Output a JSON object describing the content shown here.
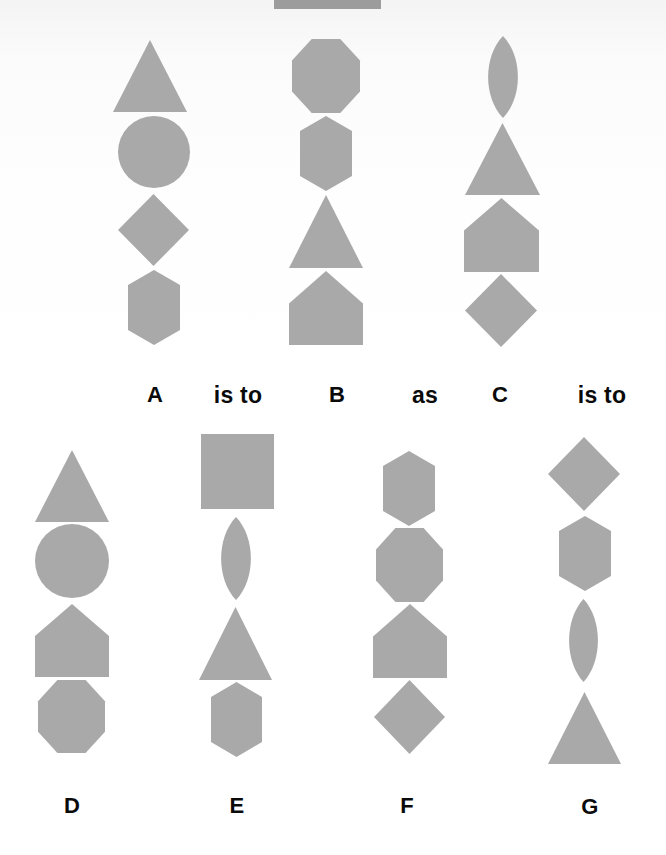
{
  "puzzle": {
    "statement_row": [
      {
        "id": "A",
        "text": "A",
        "x": 155,
        "y": 384,
        "kind": "option"
      },
      {
        "id": "is_to_1",
        "text": "is to",
        "x": 238,
        "y": 384,
        "kind": "word"
      },
      {
        "id": "B",
        "text": "B",
        "x": 337,
        "y": 384,
        "kind": "option"
      },
      {
        "id": "as",
        "text": "as",
        "x": 425,
        "y": 384,
        "kind": "word"
      },
      {
        "id": "C",
        "text": "C",
        "x": 500,
        "y": 384,
        "kind": "option"
      },
      {
        "id": "is_to_2",
        "text": "is to",
        "x": 602,
        "y": 384,
        "kind": "word"
      }
    ],
    "answer_row": [
      {
        "id": "D",
        "text": "D",
        "x": 72,
        "y": 795,
        "kind": "option"
      },
      {
        "id": "E",
        "text": "E",
        "x": 237,
        "y": 795,
        "kind": "option"
      },
      {
        "id": "F",
        "text": "F",
        "x": 407,
        "y": 795,
        "kind": "option"
      },
      {
        "id": "G",
        "text": "G",
        "x": 590,
        "y": 796,
        "kind": "option"
      }
    ]
  },
  "colors": {
    "shape_fill": "#a9a9a9",
    "label_text": "#0a0a0a",
    "background": "#ffffff"
  },
  "figures": [
    {
      "id": "A",
      "shapes": [
        {
          "type": "triangle",
          "x1": 113,
          "x2": 187,
          "y1": 40,
          "y2": 112
        },
        {
          "type": "circle",
          "cx": 154,
          "cy": 152,
          "r": 36
        },
        {
          "type": "diamond",
          "x1": 118,
          "x2": 189,
          "y1": 194,
          "y2": 266
        },
        {
          "type": "hexagon",
          "x1": 128,
          "x2": 180,
          "y1": 270,
          "y2": 345
        }
      ]
    },
    {
      "id": "B",
      "shapes": [
        {
          "type": "octagon",
          "x1": 292,
          "x2": 360,
          "y1": 39,
          "y2": 113
        },
        {
          "type": "hexagon",
          "x1": 300,
          "x2": 352,
          "y1": 116,
          "y2": 191
        },
        {
          "type": "triangle",
          "x1": 289,
          "x2": 363,
          "y1": 195,
          "y2": 268
        },
        {
          "type": "pentagon",
          "x1": 289,
          "x2": 363,
          "y1": 271,
          "y2": 345
        }
      ]
    },
    {
      "id": "C",
      "shapes": [
        {
          "type": "lens",
          "x1": 487,
          "x2": 519,
          "y1": 36,
          "y2": 118
        },
        {
          "type": "triangle",
          "x1": 465,
          "x2": 540,
          "y1": 123,
          "y2": 195
        },
        {
          "type": "pentagon",
          "x1": 464,
          "x2": 539,
          "y1": 198,
          "y2": 272
        },
        {
          "type": "diamond",
          "x1": 465,
          "x2": 537,
          "y1": 274,
          "y2": 347
        }
      ]
    },
    {
      "id": "D",
      "shapes": [
        {
          "type": "triangle",
          "x1": 35,
          "x2": 109,
          "y1": 450,
          "y2": 522
        },
        {
          "type": "circle",
          "cx": 72,
          "cy": 561,
          "r": 37
        },
        {
          "type": "pentagon",
          "x1": 35,
          "x2": 109,
          "y1": 604,
          "y2": 677
        },
        {
          "type": "octagon",
          "x1": 38,
          "x2": 105,
          "y1": 680,
          "y2": 753
        }
      ]
    },
    {
      "id": "E",
      "shapes": [
        {
          "type": "square",
          "x1": 201,
          "x2": 274,
          "y1": 434,
          "y2": 509
        },
        {
          "type": "lens",
          "x1": 220,
          "x2": 252,
          "y1": 517,
          "y2": 600
        },
        {
          "type": "triangle",
          "x1": 199,
          "x2": 272,
          "y1": 607,
          "y2": 680
        },
        {
          "type": "hexagon",
          "x1": 211,
          "x2": 262,
          "y1": 682,
          "y2": 757
        }
      ]
    },
    {
      "id": "F",
      "shapes": [
        {
          "type": "hexagon",
          "x1": 383,
          "x2": 435,
          "y1": 451,
          "y2": 526
        },
        {
          "type": "octagon",
          "x1": 376,
          "x2": 443,
          "y1": 528,
          "y2": 602
        },
        {
          "type": "pentagon",
          "x1": 373,
          "x2": 447,
          "y1": 604,
          "y2": 678
        },
        {
          "type": "diamond",
          "x1": 374,
          "x2": 445,
          "y1": 680,
          "y2": 754
        }
      ]
    },
    {
      "id": "G",
      "shapes": [
        {
          "type": "diamond",
          "x1": 548,
          "x2": 620,
          "y1": 437,
          "y2": 511
        },
        {
          "type": "hexagon",
          "x1": 559,
          "x2": 611,
          "y1": 516,
          "y2": 591
        },
        {
          "type": "lens",
          "x1": 568,
          "x2": 599,
          "y1": 599,
          "y2": 682
        },
        {
          "type": "triangle",
          "x1": 548,
          "x2": 621,
          "y1": 692,
          "y2": 764
        }
      ]
    }
  ],
  "top_bar": {
    "x1": 274,
    "x2": 381,
    "y1": 0,
    "y2": 9
  }
}
